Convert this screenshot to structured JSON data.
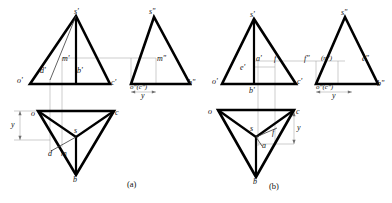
{
  "figure": {
    "captions": [
      {
        "text": "(a)",
        "x": 128,
        "y": 183
      },
      {
        "text": "(b)",
        "x": 270,
        "y": 185
      }
    ],
    "colors": {
      "outline": "#000000",
      "thin_line": "#8a8a8a",
      "text": "#111111",
      "background": "#ffffff"
    }
  },
  "part_a": {
    "name": "(a)",
    "front_view": {
      "labels": [
        {
          "id": "s-prime",
          "text": "s'",
          "x": 74,
          "y": 12
        },
        {
          "id": "o-prime",
          "text": "o'",
          "x": 18,
          "y": 82
        },
        {
          "id": "d-prime",
          "text": "d'",
          "x": 41,
          "y": 71
        },
        {
          "id": "m-prime",
          "text": "m'",
          "x": 64,
          "y": 59
        },
        {
          "id": "b-prime",
          "text": "b'",
          "x": 76,
          "y": 71
        },
        {
          "id": "c-prime",
          "text": "c'",
          "x": 110,
          "y": 83
        }
      ]
    },
    "side_view": {
      "labels": [
        {
          "id": "s-double-prime",
          "text": "s\"",
          "x": 142,
          "y": 12
        },
        {
          "id": "m-double-prime",
          "text": "m\"",
          "x": 152,
          "y": 59
        },
        {
          "id": "o-c-double-prime",
          "text": "o\"(c\")",
          "x": 128,
          "y": 86
        },
        {
          "id": "b-double-prime",
          "text": "b\"",
          "x": 186,
          "y": 83
        }
      ]
    },
    "top_view": {
      "labels": [
        {
          "id": "o-top",
          "text": "o",
          "x": 32,
          "y": 114
        },
        {
          "id": "s-top",
          "text": "s",
          "x": 73,
          "y": 130
        },
        {
          "id": "c-top",
          "text": "c",
          "x": 113,
          "y": 114
        },
        {
          "id": "d-top",
          "text": "d",
          "x": 51,
          "y": 148
        },
        {
          "id": "m-top",
          "text": "m",
          "x": 63,
          "y": 148
        },
        {
          "id": "b-top",
          "text": "b",
          "x": 73,
          "y": 177
        }
      ]
    },
    "dimensions": [
      {
        "id": "y-left",
        "text": "y",
        "x": 12,
        "y": 126
      },
      {
        "id": "y-right",
        "text": "y",
        "x": 139,
        "y": 95
      }
    ]
  },
  "part_b": {
    "name": "(b)",
    "front_view": {
      "labels": [
        {
          "id": "s-prime",
          "text": "s'",
          "x": 250,
          "y": 15
        },
        {
          "id": "o-prime",
          "text": "o'",
          "x": 214,
          "y": 82
        },
        {
          "id": "e-prime",
          "text": "e'",
          "x": 239,
          "y": 68
        },
        {
          "id": "a-prime",
          "text": "a'",
          "x": 253,
          "y": 59
        },
        {
          "id": "f-prime",
          "text": "f'",
          "x": 273,
          "y": 59
        },
        {
          "id": "b-prime",
          "text": "b'",
          "x": 249,
          "y": 92
        },
        {
          "id": "c-prime",
          "text": "c'",
          "x": 295,
          "y": 83
        }
      ]
    },
    "side_view": {
      "labels": [
        {
          "id": "s-double-prime",
          "text": "s\"",
          "x": 334,
          "y": 13
        },
        {
          "id": "f-double-prime",
          "text": "f\"",
          "x": 306,
          "y": 59
        },
        {
          "id": "n-double-prime",
          "text": "(n\")",
          "x": 325,
          "y": 59
        },
        {
          "id": "e-double-prime",
          "text": "e\"",
          "x": 362,
          "y": 59
        },
        {
          "id": "o-c-double-prime",
          "text": "o\"(c\")",
          "x": 316,
          "y": 86
        },
        {
          "id": "b-double-prime",
          "text": "b\"",
          "x": 375,
          "y": 84
        }
      ]
    },
    "top_view": {
      "labels": [
        {
          "id": "o-top",
          "text": "o",
          "x": 209,
          "y": 112
        },
        {
          "id": "s-top",
          "text": "s",
          "x": 250,
          "y": 128
        },
        {
          "id": "c-top",
          "text": "c",
          "x": 296,
          "y": 113
        },
        {
          "id": "f-top",
          "text": "f",
          "x": 272,
          "y": 133
        },
        {
          "id": "a-top",
          "text": "a",
          "x": 264,
          "y": 146
        },
        {
          "id": "b-top",
          "text": "b",
          "x": 253,
          "y": 180
        }
      ]
    },
    "dimensions": [
      {
        "id": "y-top-view",
        "text": "y",
        "x": 298,
        "y": 131
      },
      {
        "id": "y-side-view",
        "text": "y",
        "x": 331,
        "y": 95
      }
    ]
  },
  "geometry": {
    "part_a": {
      "front_triangle": "M 30,84 L 110,84 L 76,16 Z",
      "front_axis": "M 76,16 L 76,84",
      "front_md_line": "M 76,16 L 50,79",
      "side_triangle": "M 131,84 L 190,84 L 154,17 Z",
      "top_triangle": "M 38,111 L 114,111 L 76,175 Z",
      "top_spokes": [
        "M 76,137 L 38,111",
        "M 76,137 L 114,111",
        "M 76,137 L 76,175"
      ],
      "top_dm_line": "M 76,137 L 52,152"
    },
    "part_b": {
      "front_triangle": "M 222,84 L 296,84 L 254,19 Z",
      "front_axis": "M 254,19 L 254,84",
      "side_triangle": "M 316,84 L 378,84 L 345,17 Z",
      "top_triangle": "M 218,110 L 294,110 L 256,177 Z",
      "top_spokes": [
        "M 256,137 L 218,110",
        "M 256,137 L 294,110",
        "M 256,137 L 256,177"
      ],
      "top_af_line": "M 256,137 L 276,129"
    }
  }
}
